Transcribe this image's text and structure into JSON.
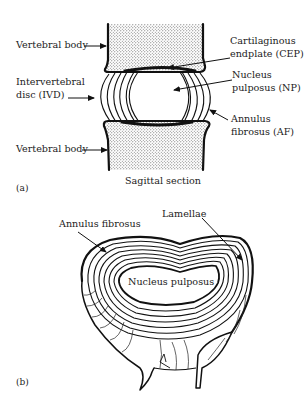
{
  "figure": {
    "panels": [
      {
        "tag": "(a)",
        "caption": "Sagittal section",
        "labels": {
          "vertebral_body_top": "Vertebral body",
          "ivd_line1": "Intervertebral",
          "ivd_line2": "disc (IVD)",
          "vertebral_body_bottom": "Vertebral body",
          "cep_line1": "Cartilaginous",
          "cep_line2": "endplate (CEP)",
          "np_line1": "Nucleus",
          "np_line2": "pulposus (NP)",
          "af_line1": "Annulus",
          "af_line2": "fibrosus (AF)"
        }
      },
      {
        "tag": "(b)",
        "labels": {
          "annulus_fibrosus": "Annulus fibrosus",
          "lamellae": "Lamellae",
          "nucleus_pulposus": "Nucleus pulposus"
        }
      }
    ],
    "colors": {
      "line": "#111111",
      "background": "#ffffff",
      "stipple": "#555555"
    }
  }
}
